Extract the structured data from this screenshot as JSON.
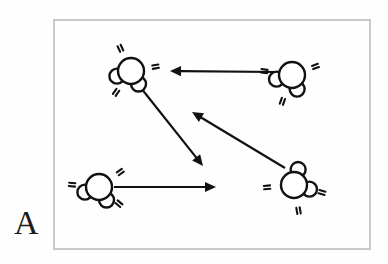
{
  "figure": {
    "panel_label": "A",
    "caption_visible": false,
    "frame": {
      "x": 53,
      "y": 19,
      "width": 318,
      "height": 231,
      "border_color": "#c9c9c9",
      "fill_color": "#fefefe",
      "border_width": 2
    },
    "ink_color": "#111111",
    "background_color": "#ffffff"
  },
  "diagram_data": {
    "type": "schematic",
    "subject": "molecules-in-random-motion",
    "molecule_style": {
      "central_atom_radius": 13,
      "satellite_atom_radius": 7.5,
      "stroke_color": "#111111",
      "fill_color": "#ffffff",
      "stroke_width": 2.4,
      "motion_mark_count": 3
    },
    "molecules": [
      {
        "id": "molecule-top-left",
        "label": "molecule-top-left",
        "cx": 131,
        "cy": 71,
        "satellites": [
          {
            "angle_deg": 300,
            "distance": 15
          },
          {
            "angle_deg": 200,
            "distance": 15
          }
        ],
        "motion_marks": [
          {
            "angle_deg": 115,
            "distance": 25
          },
          {
            "angle_deg": 10,
            "distance": 25
          },
          {
            "angle_deg": 235,
            "distance": 26
          }
        ]
      },
      {
        "id": "molecule-top-right",
        "label": "molecule-top-right",
        "cx": 292,
        "cy": 75,
        "satellites": [
          {
            "angle_deg": 290,
            "distance": 15
          },
          {
            "angle_deg": 195,
            "distance": 16
          }
        ],
        "motion_marks": [
          {
            "angle_deg": 172,
            "distance": 28
          },
          {
            "angle_deg": 20,
            "distance": 25
          },
          {
            "angle_deg": 250,
            "distance": 28
          }
        ]
      },
      {
        "id": "molecule-bottom-left",
        "label": "molecule-bottom-left",
        "cx": 99,
        "cy": 187,
        "satellites": [
          {
            "angle_deg": 300,
            "distance": 15
          },
          {
            "angle_deg": 200,
            "distance": 15
          }
        ],
        "motion_marks": [
          {
            "angle_deg": 35,
            "distance": 26
          },
          {
            "angle_deg": 175,
            "distance": 27
          },
          {
            "angle_deg": 320,
            "distance": 26
          }
        ]
      },
      {
        "id": "molecule-bottom-right",
        "label": "molecule-bottom-right",
        "cx": 294,
        "cy": 185,
        "satellites": [
          {
            "angle_deg": 345,
            "distance": 16
          },
          {
            "angle_deg": 75,
            "distance": 16
          }
        ],
        "motion_marks": [
          {
            "angle_deg": 280,
            "distance": 26
          },
          {
            "angle_deg": 345,
            "distance": 29
          },
          {
            "angle_deg": 185,
            "distance": 27
          }
        ]
      }
    ],
    "arrows": [
      {
        "id": "arrow-top-leftward",
        "label": "arrow-top-leftward",
        "from_molecule": "molecule-top-right",
        "to": "leftward",
        "x1": 277,
        "y1": 72,
        "x2": 170,
        "y2": 71,
        "head_size": 11,
        "shaft_width": 2.2
      },
      {
        "id": "arrow-diagonal-down-right",
        "label": "arrow-diagonal-down-right",
        "from_molecule": "molecule-top-left",
        "to": "down-right",
        "x1": 137,
        "y1": 83,
        "x2": 203,
        "y2": 166,
        "head_size": 11,
        "shaft_width": 2.2
      },
      {
        "id": "arrow-diagonal-up-left",
        "label": "arrow-diagonal-up-left",
        "from_molecule": "molecule-bottom-right",
        "to": "up-left",
        "x1": 285,
        "y1": 168,
        "x2": 192,
        "y2": 112,
        "head_size": 11,
        "shaft_width": 2.2
      },
      {
        "id": "arrow-bottom-rightward",
        "label": "arrow-bottom-rightward",
        "from_molecule": "molecule-bottom-left",
        "to": "rightward",
        "x1": 114,
        "y1": 187,
        "x2": 216,
        "y2": 187,
        "head_size": 11,
        "shaft_width": 2.2
      }
    ]
  }
}
